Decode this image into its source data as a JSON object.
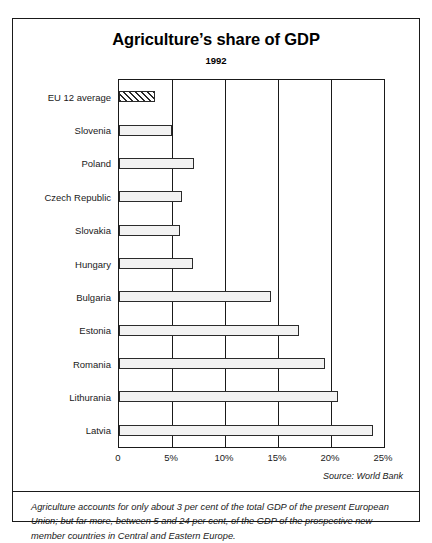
{
  "chart_data": {
    "type": "bar",
    "orientation": "horizontal",
    "title": "Agriculture’s share of GDP",
    "subtitle": "1992",
    "xlabel": "",
    "ylabel": "",
    "xlim": [
      0,
      25
    ],
    "grid": true,
    "legend": null,
    "tick_labels": [
      "0",
      "5%",
      "10%",
      "15%",
      "20%",
      "25%"
    ],
    "tick_values": [
      0,
      5,
      10,
      15,
      20,
      25
    ],
    "categories": [
      "EU 12 average",
      "Slovenia",
      "Poland",
      "Czech Republic",
      "Slovakia",
      "Hungary",
      "Bulgaria",
      "Estonia",
      "Romania",
      "Lithurania",
      "Latvia"
    ],
    "values": [
      3.4,
      5.0,
      7.1,
      5.9,
      5.8,
      7.0,
      14.3,
      17.0,
      19.4,
      20.7,
      24.0
    ],
    "styles": [
      "hatched",
      "solid",
      "solid",
      "solid",
      "solid",
      "solid",
      "solid",
      "solid",
      "solid",
      "solid",
      "solid"
    ],
    "source": "Source: World Bank"
  },
  "caption": "Agriculture accounts for only about 3 per cent of the total GDP of the present European Union; but far more, between 5 and 24 per cent, of the GDP of the prospective new member countries in Central and Eastern Europe.",
  "colors": {
    "bar_fill": "#f2f2f2",
    "bar_stroke": "#2b2b2b",
    "frame": "#1a1a1a",
    "background": "#ffffff"
  }
}
